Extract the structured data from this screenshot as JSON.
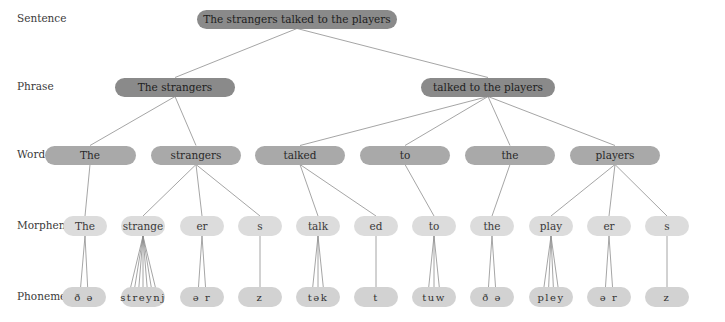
{
  "levels": [
    {
      "key": "sentence",
      "label": "Sentence",
      "y": 19
    },
    {
      "key": "phrase",
      "label": "Phrase",
      "y": 87
    },
    {
      "key": "word",
      "label": "Word",
      "y": 155
    },
    {
      "key": "morpheme",
      "label": "Morpheme",
      "y": 226
    },
    {
      "key": "phoneme",
      "label": "Phoneme",
      "y": 297
    }
  ],
  "nodes": {
    "sentence": [
      {
        "id": "s",
        "text": "The strangers talked to the players",
        "x": 297,
        "w": 200
      }
    ],
    "phrase": [
      {
        "id": "p1",
        "text": "The strangers",
        "x": 175,
        "w": 120,
        "parent": "s"
      },
      {
        "id": "p2",
        "text": "talked to the players",
        "x": 488,
        "w": 134,
        "parent": "s"
      }
    ],
    "word": [
      {
        "id": "w1",
        "text": "The",
        "x": 90,
        "w": 91,
        "parent": "p1"
      },
      {
        "id": "w2",
        "text": "strangers",
        "x": 196,
        "w": 90,
        "parent": "p1"
      },
      {
        "id": "w3",
        "text": "talked",
        "x": 300,
        "w": 90,
        "parent": "p2"
      },
      {
        "id": "w4",
        "text": "to",
        "x": 405,
        "w": 90,
        "parent": "p2"
      },
      {
        "id": "w5",
        "text": "the",
        "x": 510,
        "w": 90,
        "parent": "p2"
      },
      {
        "id": "w6",
        "text": "players",
        "x": 615,
        "w": 90,
        "parent": "p2"
      }
    ],
    "morpheme": [
      {
        "id": "m1",
        "text": "The",
        "x": 85,
        "w": 44,
        "parent": "w1"
      },
      {
        "id": "m2",
        "text": "strange",
        "x": 143,
        "w": 44,
        "parent": "w2"
      },
      {
        "id": "m3",
        "text": "er",
        "x": 202,
        "w": 44,
        "parent": "w2"
      },
      {
        "id": "m4",
        "text": "s",
        "x": 260,
        "w": 44,
        "parent": "w2"
      },
      {
        "id": "m5",
        "text": "talk",
        "x": 318,
        "w": 44,
        "parent": "w3"
      },
      {
        "id": "m6",
        "text": "ed",
        "x": 376,
        "w": 44,
        "parent": "w3"
      },
      {
        "id": "m7",
        "text": "to",
        "x": 434,
        "w": 44,
        "parent": "w4"
      },
      {
        "id": "m8",
        "text": "the",
        "x": 492,
        "w": 44,
        "parent": "w5"
      },
      {
        "id": "m9",
        "text": "play",
        "x": 551,
        "w": 44,
        "parent": "w6"
      },
      {
        "id": "m10",
        "text": "er",
        "x": 609,
        "w": 44,
        "parent": "w6"
      },
      {
        "id": "m11",
        "text": "s",
        "x": 667,
        "w": 44,
        "parent": "w6"
      }
    ],
    "phoneme": [
      {
        "id": "ph1",
        "text": "ð ə",
        "x": 84,
        "w": 44,
        "parent": "m1",
        "n": 2
      },
      {
        "id": "ph2",
        "text": "streynj",
        "x": 143,
        "w": 44,
        "parent": "m2",
        "n": 7
      },
      {
        "id": "ph3",
        "text": "ə r",
        "x": 202,
        "w": 44,
        "parent": "m3",
        "n": 2
      },
      {
        "id": "ph4",
        "text": "z",
        "x": 260,
        "w": 44,
        "parent": "m4",
        "n": 1
      },
      {
        "id": "ph5",
        "text": "tək",
        "x": 318,
        "w": 44,
        "parent": "m5",
        "n": 3
      },
      {
        "id": "ph6",
        "text": "t",
        "x": 376,
        "w": 44,
        "parent": "m6",
        "n": 1
      },
      {
        "id": "ph7",
        "text": "tuw",
        "x": 434,
        "w": 44,
        "parent": "m7",
        "n": 3
      },
      {
        "id": "ph8",
        "text": "ð ə",
        "x": 492,
        "w": 44,
        "parent": "m8",
        "n": 2
      },
      {
        "id": "ph9",
        "text": "pley",
        "x": 551,
        "w": 44,
        "parent": "m9",
        "n": 4
      },
      {
        "id": "ph10",
        "text": "ə r",
        "x": 609,
        "w": 44,
        "parent": "m10",
        "n": 2
      },
      {
        "id": "ph11",
        "text": "z",
        "x": 667,
        "w": 44,
        "parent": "m11",
        "n": 1
      }
    ]
  },
  "colors": {
    "sentence_fill": "#8a8a8a",
    "phrase_fill": "#8a8a8a",
    "word_fill": "#a9a9a9",
    "morpheme_fill": "#dcdcdc",
    "phoneme_fill": "#d2d2d2",
    "line": "#8e8e8e"
  }
}
